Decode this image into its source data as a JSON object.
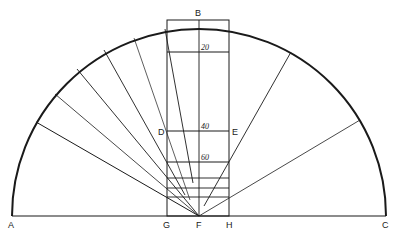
{
  "labels": {
    "A": "A",
    "B": "B",
    "C": "C",
    "D": "D",
    "E": "E",
    "F": "F",
    "G": "G",
    "H": "H",
    "mark_20": "20",
    "mark_40": "40",
    "mark_60": "60"
  },
  "geometry": {
    "center": [
      199,
      216
    ],
    "radius": 187,
    "baseline_y": 216,
    "rect": {
      "left": 167,
      "right": 229,
      "top": 20,
      "bottom": 216
    },
    "horizontal_lines_y": [
      52,
      131,
      162,
      178,
      188,
      197
    ],
    "left_rays": [
      {
        "from": [
          36,
          122
        ],
        "to": [
          199,
          216
        ]
      },
      {
        "from": [
          55,
          94
        ],
        "to": [
          199,
          216
        ]
      },
      {
        "from": [
          77,
          69
        ],
        "to": [
          199,
          216
        ]
      },
      {
        "from": [
          104,
          50
        ],
        "to": [
          185,
          195
        ]
      },
      {
        "from": [
          134,
          38
        ],
        "to": [
          190,
          200
        ]
      },
      {
        "from": [
          165,
          29
        ],
        "to": [
          193,
          183
        ]
      }
    ],
    "right_rays": [
      {
        "from": [
          291,
          52
        ],
        "to": [
          204,
          206
        ]
      },
      {
        "from": [
          360,
          120
        ],
        "to": [
          199,
          216
        ]
      }
    ]
  },
  "colors": {
    "stroke": "#1a1a1a",
    "background": "#ffffff"
  }
}
